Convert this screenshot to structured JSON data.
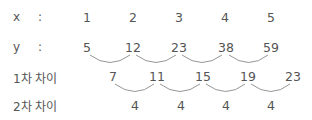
{
  "rows": {
    "x": {
      "label": "x",
      "colon": ":",
      "values": [
        "1",
        "2",
        "3",
        "4",
        "5"
      ]
    },
    "y": {
      "label": "y",
      "colon": ":",
      "values": [
        "5",
        "12",
        "23",
        "38",
        "59"
      ]
    },
    "d1": {
      "label": "1차 차이",
      "values": [
        "7",
        "11",
        "15",
        "19",
        "23"
      ]
    },
    "d2": {
      "label": "2차 차이",
      "values": [
        "4",
        "4",
        "4",
        "4"
      ]
    }
  },
  "colors": {
    "text": "#555555",
    "arc": "#888888"
  }
}
